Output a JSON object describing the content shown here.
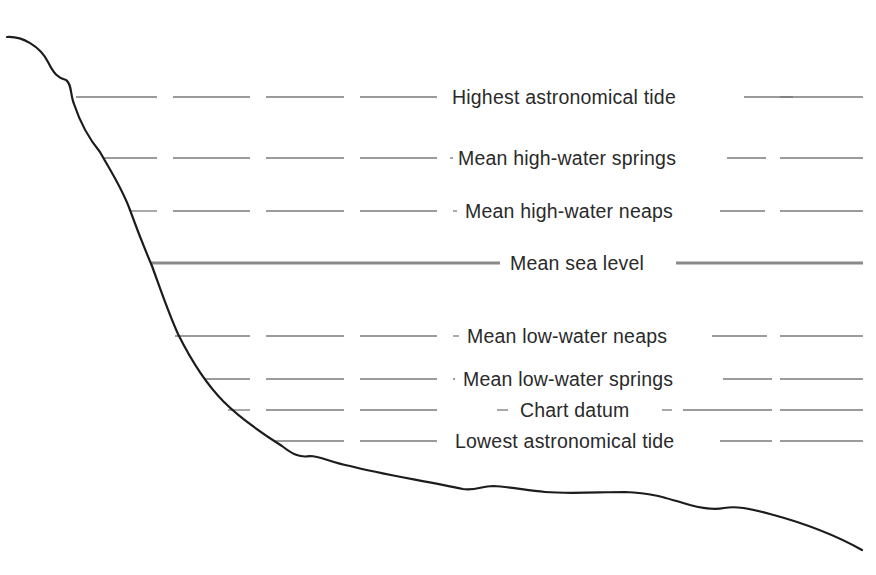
{
  "diagram": {
    "colors": {
      "profile": "#1c1c1c",
      "dash": "#7a7a7a",
      "msl": "#8a8a8a",
      "text": "#2a2a2a",
      "background": "#ffffff"
    },
    "levels": [
      {
        "label": "Highest astronomical tide",
        "y": 97,
        "line_start": 76,
        "text_x": 452,
        "text_end": 736,
        "right_dashes": [
          [
            744,
            793
          ],
          [
            780,
            863
          ]
        ],
        "style": "dashed"
      },
      {
        "label": "Mean high-water springs",
        "y": 158,
        "line_start": 103,
        "text_x": 458,
        "text_end": 717,
        "right_dashes": [
          [
            727,
            766
          ],
          [
            780,
            863
          ]
        ],
        "style": "dashed"
      },
      {
        "label": "Mean high-water neaps",
        "y": 211,
        "line_start": 130,
        "text_x": 465,
        "text_end": 712,
        "right_dashes": [
          [
            720,
            765
          ],
          [
            780,
            863
          ]
        ],
        "style": "dashed"
      },
      {
        "label": "Mean sea level",
        "y": 263,
        "line_start": 150,
        "text_x": 510,
        "text_end": 668,
        "right_dashes": [
          [
            676,
            863
          ]
        ],
        "style": "solid"
      },
      {
        "label": "Mean low-water neaps",
        "y": 336,
        "line_start": 175,
        "text_x": 467,
        "text_end": 704,
        "right_dashes": [
          [
            712,
            767
          ],
          [
            780,
            863
          ]
        ],
        "style": "dashed"
      },
      {
        "label": "Mean low-water springs",
        "y": 379,
        "line_start": 205,
        "text_x": 463,
        "text_end": 714,
        "right_dashes": [
          [
            723,
            772
          ],
          [
            780,
            863
          ]
        ],
        "style": "dashed"
      },
      {
        "label": "Chart datum",
        "y": 410,
        "line_start": 228,
        "text_x": 520,
        "text_end": 654,
        "right_dashes": [
          [
            662,
            672
          ],
          [
            683,
            772
          ],
          [
            780,
            863
          ]
        ],
        "style": "dashed",
        "pre_text_dash": [
          497,
          508
        ]
      },
      {
        "label": "Lowest astronomical tide",
        "y": 441,
        "line_start": 275,
        "text_x": 455,
        "text_end": 718,
        "right_dashes": [
          [
            720,
            772
          ],
          [
            780,
            863
          ]
        ],
        "style": "dashed"
      }
    ],
    "left_dashes": [
      [
        0,
        157
      ],
      [
        173,
        250
      ],
      [
        266,
        344
      ],
      [
        360,
        437
      ]
    ],
    "profile_points": "M7,37 C22,36 40,46 48,62 C54,74 58,78 66,80 C72,84 70,94 74,104 C80,122 90,140 100,152 C110,170 122,188 130,210 C138,232 146,252 152,266 C160,288 168,312 178,334 C190,358 204,382 224,402 C240,418 260,432 282,446 C292,454 300,458 310,456 C320,456 330,462 350,466 C380,474 420,480 463,489 C475,491 482,486 493,486 C510,487 525,490 545,492 C570,494 600,492 625,492 C650,493 660,496 690,505 C705,509 714,510 724,508 C736,506 748,508 770,514 C800,522 830,532 862,550"
  }
}
